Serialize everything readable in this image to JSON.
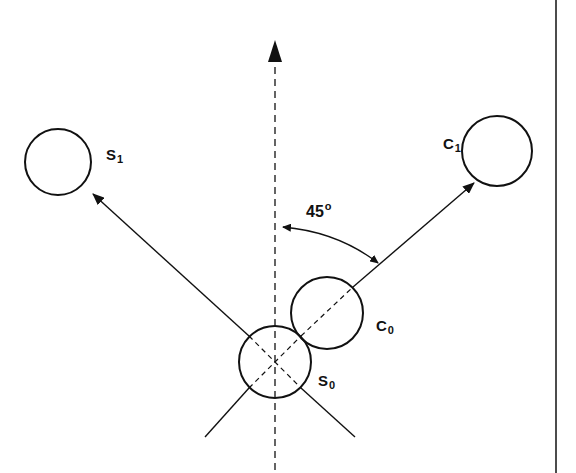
{
  "diagram": {
    "title": "",
    "colors": {
      "ink": "#111111",
      "background": "#ffffff"
    },
    "axis": {
      "style": "dashed",
      "direction": "vertical-up"
    },
    "angle": {
      "value": "45",
      "unit": "°",
      "label": "45°"
    },
    "circles": [
      {
        "id": "S1",
        "letter": "S",
        "sub": "1"
      },
      {
        "id": "C1",
        "letter": "C",
        "sub": "1"
      },
      {
        "id": "C0",
        "letter": "C",
        "sub": "0"
      },
      {
        "id": "S0",
        "letter": "S",
        "sub": "0"
      }
    ],
    "labels": {
      "s1": {
        "letter": "S",
        "sub": "1"
      },
      "c1": {
        "letter": "C",
        "sub": "1"
      },
      "c0": {
        "letter": "C",
        "sub": "0"
      },
      "s0": {
        "letter": "S",
        "sub": "0"
      },
      "angle": {
        "value": "45",
        "unit": "o"
      }
    }
  }
}
